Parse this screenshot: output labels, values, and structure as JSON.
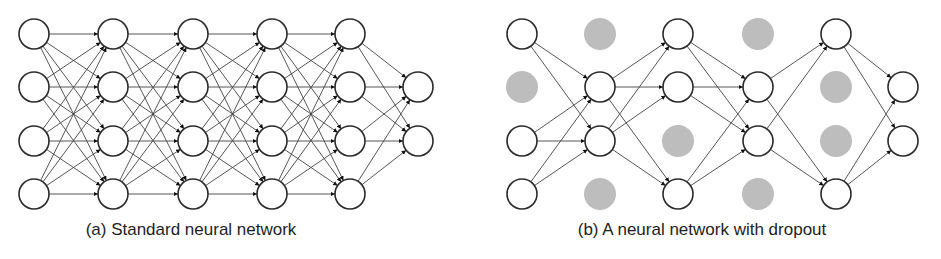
{
  "colors": {
    "edge": "#444444",
    "node_stroke": "#2a2a2a",
    "node_fill": "#ffffff",
    "dropped_fill": "#bdbdbd"
  },
  "node_radius": 15,
  "row_y": [
    34,
    87,
    141,
    194
  ],
  "panels": [
    {
      "id": "standard",
      "caption": "(a) Standard neural network",
      "columns": [
        {
          "x": 34,
          "rows": [
            0,
            1,
            2,
            3
          ],
          "dropped": []
        },
        {
          "x": 113,
          "rows": [
            0,
            1,
            2,
            3
          ],
          "dropped": []
        },
        {
          "x": 193,
          "rows": [
            0,
            1,
            2,
            3
          ],
          "dropped": []
        },
        {
          "x": 272,
          "rows": [
            0,
            1,
            2,
            3
          ],
          "dropped": []
        },
        {
          "x": 350,
          "rows": [
            0,
            1,
            2,
            3
          ],
          "dropped": []
        },
        {
          "x": 418,
          "rows": [
            1,
            2
          ],
          "dropped": []
        }
      ]
    },
    {
      "id": "dropout",
      "caption": "(b) A neural network with dropout",
      "columns": [
        {
          "x": 522,
          "rows": [
            0,
            1,
            2,
            3
          ],
          "dropped": [
            1
          ]
        },
        {
          "x": 600,
          "rows": [
            0,
            1,
            2,
            3
          ],
          "dropped": [
            0,
            3
          ]
        },
        {
          "x": 678,
          "rows": [
            0,
            1,
            2,
            3
          ],
          "dropped": [
            2
          ]
        },
        {
          "x": 758,
          "rows": [
            0,
            1,
            2,
            3
          ],
          "dropped": [
            0,
            3
          ]
        },
        {
          "x": 836,
          "rows": [
            0,
            1,
            2,
            3
          ],
          "dropped": [
            1,
            2
          ]
        },
        {
          "x": 903,
          "rows": [
            1,
            2
          ],
          "dropped": []
        }
      ]
    }
  ]
}
